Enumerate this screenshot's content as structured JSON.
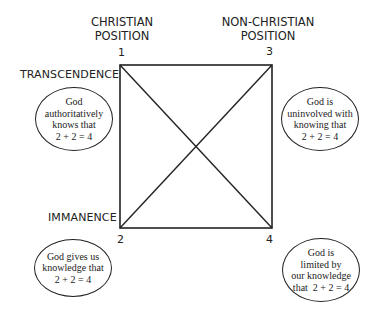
{
  "columns": {
    "left": "CHRISTIAN POSITION",
    "left_lines": [
      "CHRISTIAN",
      "POSITION"
    ],
    "right_lines": [
      "NON-CHRISTIAN",
      "POSITION"
    ]
  },
  "rows": {
    "top": "TRANSCENDENCE",
    "bottom": "IMMANENCE"
  },
  "corners": {
    "c1": "1",
    "c2": "2",
    "c3": "3",
    "c4": "4"
  },
  "bubbles": {
    "b1": [
      "God authoritatively",
      "knows that",
      "2 + 2 = 4"
    ],
    "b2": [
      "God gives us",
      "knowledge that",
      "2 + 2 = 4"
    ],
    "b3": [
      "God is",
      "uninvolved with",
      "knowing that",
      "2 + 2 = 4"
    ],
    "b4": [
      "God is",
      "limited by",
      "our knowledge",
      "that  2 + 2 = 4"
    ]
  },
  "colors": {
    "line": "#222222",
    "background": "#ffffff"
  }
}
